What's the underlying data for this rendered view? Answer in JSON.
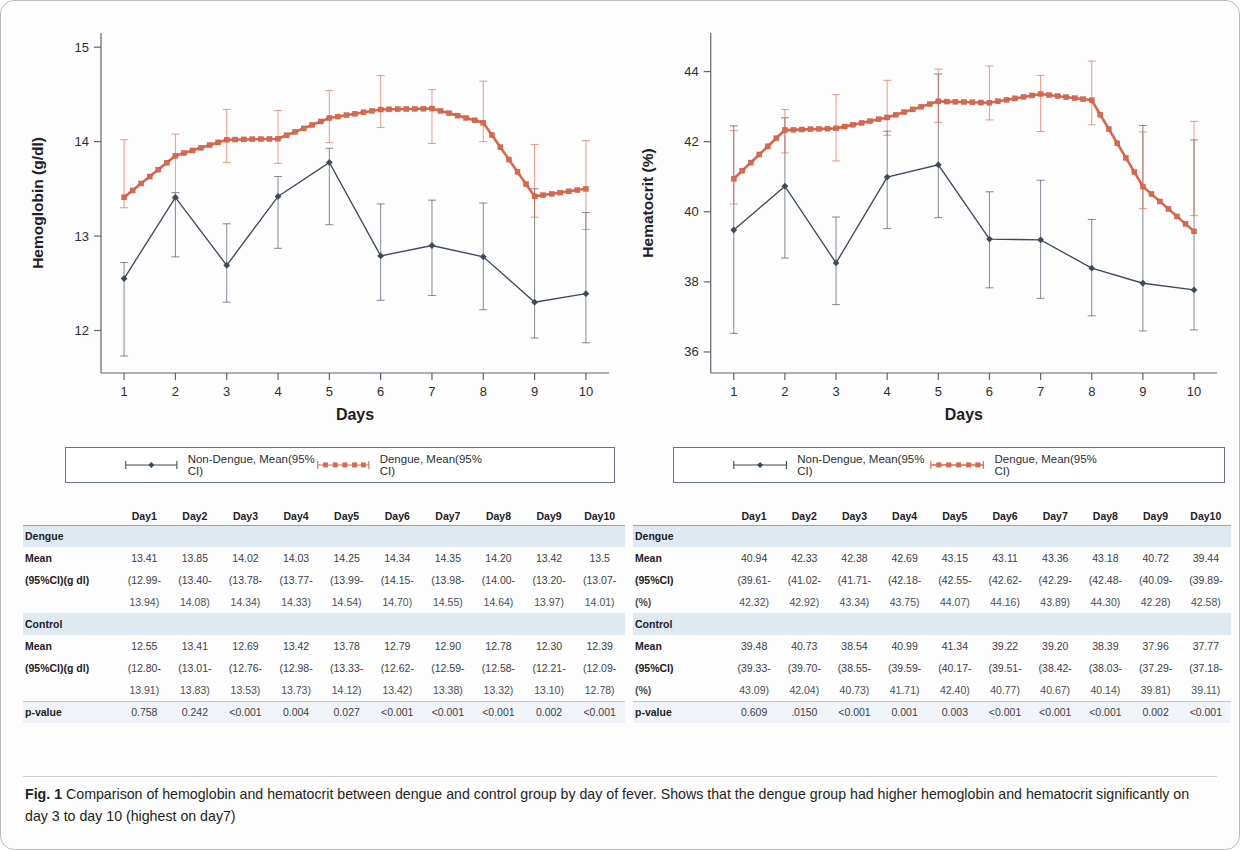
{
  "figure": {
    "label": "Fig. 1",
    "caption": "Comparison of hemoglobin and hematocrit between dengue and control group by day of fever. Shows that the dengue group had higher hemoglobin and hematocrit significantly on day 3 to day 10 (highest on day7)"
  },
  "colors": {
    "dengue": "#d9684f",
    "non_dengue": "#3d4a5c",
    "axis": "#5c6570",
    "group_row_bg": "#dfe9f2"
  },
  "legend": {
    "non_dengue_label": "Non-Dengue, Mean(95% CI)",
    "dengue_label": "Dengue, Mean(95% CI)"
  },
  "chart_data": [
    {
      "type": "line",
      "id": "hemoglobin",
      "title": "",
      "xlabel": "Days",
      "ylabel": "Hemoglobin (g/dl)",
      "xticks": [
        "1",
        "2",
        "3",
        "4",
        "5",
        "6",
        "7",
        "8",
        "9",
        "10"
      ],
      "yticks": [
        "12",
        "13",
        "14",
        "15"
      ],
      "x": [
        1,
        2,
        3,
        4,
        5,
        6,
        7,
        8,
        9,
        10
      ],
      "xlim": [
        0.55,
        10.45
      ],
      "ylim": [
        11.55,
        15.15
      ],
      "grid": false,
      "legend_position": "below",
      "series": [
        {
          "name": "Dengue, Mean(95% CI)",
          "color": "#d9684f",
          "marker": "square",
          "values": [
            13.41,
            13.85,
            14.02,
            14.03,
            14.25,
            14.34,
            14.35,
            14.2,
            13.42,
            13.5
          ],
          "ci_low": [
            13.3,
            13.4,
            13.78,
            13.77,
            13.99,
            14.15,
            13.98,
            14.0,
            13.2,
            13.07
          ],
          "ci_high": [
            14.02,
            14.08,
            14.34,
            14.33,
            14.54,
            14.7,
            14.55,
            14.64,
            13.97,
            14.01
          ]
        },
        {
          "name": "Non-Dengue, Mean(95% CI)",
          "color": "#3d4a5c",
          "marker": "diamond",
          "values": [
            12.55,
            13.41,
            12.69,
            13.42,
            13.78,
            12.79,
            12.9,
            12.78,
            12.3,
            12.39
          ],
          "ci_low": [
            11.73,
            12.78,
            12.3,
            12.87,
            13.12,
            12.32,
            12.37,
            12.22,
            11.92,
            11.87
          ],
          "ci_high": [
            12.72,
            13.46,
            13.13,
            13.63,
            13.93,
            13.34,
            13.38,
            13.35,
            13.5,
            13.25
          ]
        }
      ]
    },
    {
      "type": "line",
      "id": "hematocrit",
      "title": "",
      "xlabel": "Days",
      "ylabel": "Hematocrit (%)",
      "xticks": [
        "1",
        "2",
        "3",
        "4",
        "5",
        "6",
        "7",
        "8",
        "9",
        "10"
      ],
      "yticks": [
        "36",
        "38",
        "40",
        "42",
        "44"
      ],
      "x": [
        1,
        2,
        3,
        4,
        5,
        6,
        7,
        8,
        9,
        10
      ],
      "xlim": [
        0.55,
        10.45
      ],
      "ylim": [
        35.4,
        45.1
      ],
      "grid": false,
      "legend_position": "below",
      "series": [
        {
          "name": "Dengue, Mean(95% CI)",
          "color": "#d9684f",
          "marker": "square",
          "values": [
            40.94,
            42.33,
            42.38,
            42.69,
            43.15,
            43.11,
            43.36,
            43.18,
            40.72,
            39.44
          ],
          "ci_low": [
            40.22,
            41.68,
            41.45,
            42.18,
            42.55,
            42.62,
            42.29,
            42.48,
            40.09,
            39.89
          ],
          "ci_high": [
            42.32,
            42.92,
            43.34,
            43.75,
            44.07,
            44.16,
            43.89,
            44.3,
            42.28,
            42.58
          ]
        },
        {
          "name": "Non-Dengue, Mean(95% CI)",
          "color": "#3d4a5c",
          "marker": "diamond",
          "values": [
            39.48,
            40.73,
            38.54,
            40.99,
            41.34,
            39.22,
            39.2,
            38.39,
            37.96,
            37.77
          ],
          "ci_low": [
            36.53,
            38.68,
            37.35,
            39.52,
            39.83,
            37.83,
            37.53,
            37.03,
            36.6,
            36.63
          ],
          "ci_high": [
            42.45,
            42.68,
            39.85,
            42.3,
            43.93,
            40.57,
            40.9,
            39.78,
            42.46,
            42.05
          ]
        }
      ]
    }
  ],
  "tables": [
    {
      "id": "hemoglobin-table",
      "unit_suffix": "(g/dl)",
      "columns": [
        "",
        "Day1",
        "Day2",
        "Day3",
        "Day4",
        "Day5",
        "Day6",
        "Day7",
        "Day8",
        "Day9",
        "Day10"
      ],
      "rows": [
        {
          "type": "group",
          "label": "Dengue",
          "cells": [
            "",
            "",
            "",
            "",
            "",
            "",
            "",
            "",
            "",
            ""
          ]
        },
        {
          "type": "data",
          "label": "Mean",
          "cells": [
            "13.41",
            "13.85",
            "14.02",
            "14.03",
            "14.25",
            "14.34",
            "14.35",
            "14.20",
            "13.42",
            "13.5"
          ]
        },
        {
          "type": "data",
          "label": "(95%CI)(g dl)",
          "cells": [
            "(12.99-",
            "(13.40-",
            "(13.78-",
            "(13.77-",
            "(13.99-",
            "(14.15-",
            "(13.98-",
            "(14.00-",
            "(13.20-",
            "(13.07-"
          ]
        },
        {
          "type": "cont",
          "label": "",
          "cells": [
            "13.94)",
            "14.08)",
            "14.34)",
            "14.33)",
            "14.54)",
            "14.70)",
            "14.55)",
            "14.64)",
            "13.97)",
            "14.01)"
          ]
        },
        {
          "type": "group",
          "label": "Control",
          "cells": [
            "",
            "",
            "",
            "",
            "",
            "",
            "",
            "",
            "",
            ""
          ]
        },
        {
          "type": "data",
          "label": "Mean",
          "cells": [
            "12.55",
            "13.41",
            "12.69",
            "13.42",
            "13.78",
            "12.79",
            "12.90",
            "12.78",
            "12.30",
            "12.39"
          ]
        },
        {
          "type": "data",
          "label": "(95%CI)(g dl)",
          "cells": [
            "(12.80-",
            "(13.01-",
            "(12.76-",
            "(12.98-",
            "(13.33-",
            "(12.62-",
            "(12.59-",
            "(12.58-",
            "(12.21-",
            "(12.09-"
          ]
        },
        {
          "type": "cont",
          "label": "",
          "cells": [
            "13.91)",
            "13.83)",
            "13.53)",
            "13.73)",
            "14.12)",
            "13.42)",
            "13.38)",
            "13.32)",
            "13.10)",
            "12.78)"
          ]
        },
        {
          "type": "pval",
          "label": "p-value",
          "cells": [
            "0.758",
            "0.242",
            "<0.001",
            "0.004",
            "0.027",
            "<0.001",
            "<0.001",
            "<0.001",
            "0.002",
            "<0.001"
          ]
        }
      ]
    },
    {
      "id": "hematocrit-table",
      "unit_suffix": "(%)",
      "columns": [
        "",
        "Day1",
        "Day2",
        "Day3",
        "Day4",
        "Day5",
        "Day6",
        "Day7",
        "Day8",
        "Day9",
        "Day10"
      ],
      "rows": [
        {
          "type": "group",
          "label": "Dengue",
          "cells": [
            "",
            "",
            "",
            "",
            "",
            "",
            "",
            "",
            "",
            ""
          ]
        },
        {
          "type": "data",
          "label": "Mean",
          "cells": [
            "40.94",
            "42.33",
            "42.38",
            "42.69",
            "43.15",
            "43.11",
            "43.36",
            "43.18",
            "40.72",
            "39.44"
          ]
        },
        {
          "type": "data",
          "label": "(95%CI)",
          "cells": [
            "(39.61-",
            "(41.02-",
            "(41.71-",
            "(42.18-",
            "(42.55-",
            "(42.62-",
            "(42.29-",
            "(42.48-",
            "(40.09-",
            "(39.89-"
          ]
        },
        {
          "type": "cont",
          "label": "(%)",
          "cells": [
            "42.32)",
            "42.92)",
            "43.34)",
            "43.75)",
            "44.07)",
            "44.16)",
            "43.89)",
            "44.30)",
            "42.28)",
            "42.58)"
          ]
        },
        {
          "type": "group",
          "label": "Control",
          "cells": [
            "",
            "",
            "",
            "",
            "",
            "",
            "",
            "",
            "",
            ""
          ]
        },
        {
          "type": "data",
          "label": "Mean",
          "cells": [
            "39.48",
            "40.73",
            "38.54",
            "40.99",
            "41.34",
            "39.22",
            "39.20",
            "38.39",
            "37.96",
            "37.77"
          ]
        },
        {
          "type": "data",
          "label": "(95%CI)",
          "cells": [
            "(39.33-",
            "(39.70-",
            "(38.55-",
            "(39.59-",
            "(40.17-",
            "(39.51-",
            "(38.42-",
            "(38.03-",
            "(37.29-",
            "(37.18-"
          ]
        },
        {
          "type": "cont",
          "label": "(%)",
          "cells": [
            "43.09)",
            "42.04)",
            "40.73)",
            "41.71)",
            "42.40)",
            "40.77)",
            "40.67)",
            "40.14)",
            "39.81)",
            "39.11)"
          ]
        },
        {
          "type": "pval",
          "label": "p-value",
          "cells": [
            "0.609",
            ".0150",
            "<0.001",
            "0.001",
            "0.003",
            "<0.001",
            "<0.001",
            "<0.001",
            "0.002",
            "<0.001"
          ]
        }
      ]
    }
  ]
}
